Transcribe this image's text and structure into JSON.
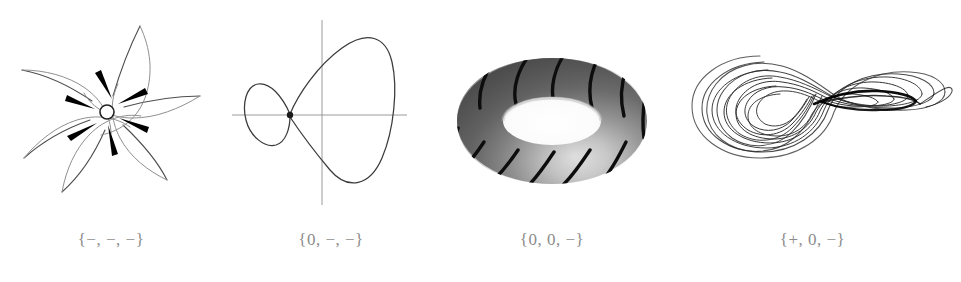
{
  "figure": {
    "background_color": "#ffffff",
    "ink_color": "#1a1a1a",
    "label_color": "#8c8c8c",
    "panel_count": 4
  },
  "panels": [
    {
      "id": "fixed-point-spiral-sink",
      "label": "{−, −, −}",
      "caption_signs": [
        "−",
        "−",
        "−"
      ],
      "attractor_type": "fixed point (spiral sink)",
      "art": {
        "kind": "spiral-sink",
        "center_x": 107,
        "center_y": 112,
        "hub_radius": 7,
        "arm_count": 6,
        "arrowhead_count": 6,
        "flow_direction": "inward"
      }
    },
    {
      "id": "limit-cycle-homoclinic-orbit",
      "label": "{0, −, −}",
      "caption_signs": [
        "0",
        "−",
        "−"
      ],
      "attractor_type": "limit cycle (periodic orbit)",
      "art": {
        "kind": "homoclinic-loop-with-axes",
        "axes": true,
        "origin_x": 322,
        "origin_y": 115,
        "fixed_point_x": 290,
        "fixed_point_y": 115,
        "loops": 2
      }
    },
    {
      "id": "torus-quasiperiodic",
      "label": "{0, 0, −}",
      "caption_signs": [
        "0",
        "0",
        "−"
      ],
      "attractor_type": "2-torus (quasiperiodic)",
      "art": {
        "kind": "shaded-torus",
        "center_x": 542,
        "center_y": 121,
        "outer_rx": 95,
        "outer_ry": 63,
        "hole_rx": 42,
        "hole_ry": 22,
        "winding_stripe_count": 12,
        "shading": "grayscale, dark outer upper-left, light inner lower-right"
      }
    },
    {
      "id": "strange-attractor-chaos",
      "label": "{+, 0, −}",
      "caption_signs": [
        "+",
        "0",
        "−"
      ],
      "attractor_type": "strange attractor (chaotic)",
      "art": {
        "kind": "roessler-attractor",
        "spiral_center_x": 758,
        "spiral_center_y": 118,
        "spiral_turn_count": 9,
        "fold_band": true,
        "fold_tip_x": 940
      }
    }
  ]
}
